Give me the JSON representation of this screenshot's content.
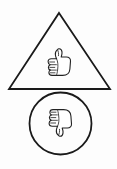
{
  "figure": {
    "background_color": "#fdfdfd",
    "stroke_color": "#1a1a1a",
    "glyph_stroke_color": "#222222",
    "glyph_fill_color": "#ffffff",
    "canvas": {
      "width": 117,
      "height": 169
    }
  },
  "shapes": [
    {
      "id": "triangle",
      "name": "triangle-outline",
      "type": "triangle",
      "apex": {
        "x": 59,
        "y": 13
      },
      "bottom_left": {
        "x": 9,
        "y": 89
      },
      "bottom_right": {
        "x": 110,
        "y": 89
      },
      "stroke_width": 1.8,
      "fill": "none",
      "contains_icon": "thumbs-up-icon"
    },
    {
      "id": "circle",
      "name": "circle-outline",
      "type": "circle",
      "center": {
        "x": 60.5,
        "y": 123.5
      },
      "radius": 31,
      "stroke_width": 1.8,
      "fill": "none",
      "contains_icon": "thumbs-down-icon"
    }
  ],
  "icons": [
    {
      "id": "thumbs_up",
      "name": "thumbs-up-icon",
      "semantic": "thumbs-up",
      "label": "Thumbs Up",
      "center": {
        "x": 59,
        "y": 62
      },
      "width": 23,
      "height": 25,
      "orientation": "up",
      "inside_shape": "triangle"
    },
    {
      "id": "thumbs_down",
      "name": "thumbs-down-icon",
      "semantic": "thumbs-down",
      "label": "Thumbs Down",
      "center": {
        "x": 60,
        "y": 123
      },
      "width": 23,
      "height": 26,
      "orientation": "down",
      "inside_shape": "circle"
    }
  ]
}
